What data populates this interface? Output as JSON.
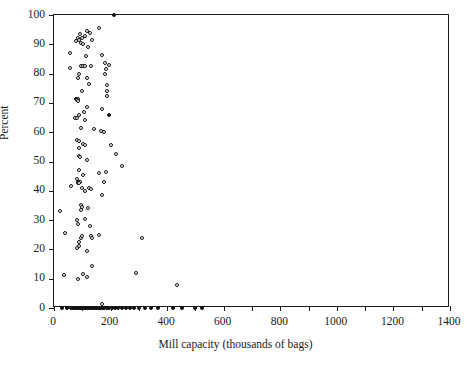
{
  "chart_data": {
    "type": "scatter",
    "title": "",
    "xlabel": "Mill capacity (thousands of bags)",
    "ylabel": "Percent",
    "xlim": [
      0,
      1400
    ],
    "ylim": [
      0,
      100
    ],
    "xticks": [
      0,
      100,
      200,
      300,
      400,
      500,
      600,
      700,
      800,
      900,
      1000,
      1100,
      1200,
      1300,
      1400
    ],
    "xtick_labels": [
      "0",
      "",
      "200",
      "",
      "400",
      "",
      "600",
      "",
      "800",
      "",
      "1000",
      "",
      "1200",
      "",
      "1400"
    ],
    "xtick_labels_shown": [
      "0",
      "200",
      "400",
      "600",
      "800",
      "1000",
      "1200",
      "1400"
    ],
    "yticks": [
      0,
      10,
      20,
      30,
      40,
      50,
      60,
      70,
      80,
      90,
      100
    ],
    "ytick_labels": [
      "0",
      "10",
      "20",
      "30",
      "40",
      "50",
      "60",
      "70",
      "80",
      "90",
      "100"
    ],
    "grid": false,
    "legend": false,
    "marker": "open-diamond",
    "marker_color": "#111111",
    "frame": "box",
    "series": [
      {
        "name": "mills",
        "points": [
          [
            212,
            100
          ],
          [
            160,
            95.5
          ],
          [
            115,
            94.5
          ],
          [
            128,
            94.0
          ],
          [
            93,
            93.5
          ],
          [
            108,
            93.0
          ],
          [
            100,
            92.0
          ],
          [
            86,
            92.0
          ],
          [
            90,
            91.5
          ],
          [
            133,
            91.5
          ],
          [
            78,
            91.0
          ],
          [
            96,
            90.5
          ],
          [
            103,
            90.0
          ],
          [
            120,
            89.0
          ],
          [
            58,
            87.0
          ],
          [
            170,
            86.5
          ],
          [
            113,
            86.0
          ],
          [
            55,
            82.0
          ],
          [
            180,
            83.5
          ],
          [
            195,
            83.0
          ],
          [
            96,
            82.5
          ],
          [
            104,
            82.5
          ],
          [
            110,
            82.5
          ],
          [
            130,
            82.5
          ],
          [
            185,
            81.5
          ],
          [
            88,
            80.0
          ],
          [
            180,
            80.0
          ],
          [
            84,
            78.5
          ],
          [
            118,
            78.5
          ],
          [
            122,
            76.5
          ],
          [
            187,
            76.0
          ],
          [
            100,
            74.0
          ],
          [
            186,
            74.0
          ],
          [
            186,
            72.5
          ],
          [
            78,
            71.5
          ],
          [
            82,
            71.5
          ],
          [
            86,
            71.5
          ],
          [
            80,
            71.0
          ],
          [
            84,
            70.5
          ],
          [
            118,
            68.5
          ],
          [
            168,
            68.0
          ],
          [
            105,
            67.0
          ],
          [
            193,
            66.0
          ],
          [
            90,
            66.0
          ],
          [
            74,
            65.0
          ],
          [
            82,
            64.8
          ],
          [
            108,
            64.0
          ],
          [
            94,
            61.5
          ],
          [
            143,
            61.0
          ],
          [
            167,
            60.5
          ],
          [
            175,
            60.0
          ],
          [
            80,
            57.5
          ],
          [
            88,
            57.0
          ],
          [
            101,
            56.0
          ],
          [
            110,
            55.5
          ],
          [
            200,
            55.5
          ],
          [
            88,
            54.5
          ],
          [
            90,
            52.0
          ],
          [
            92,
            51.5
          ],
          [
            218,
            52.5
          ],
          [
            115,
            50.5
          ],
          [
            240,
            48.5
          ],
          [
            90,
            47.0
          ],
          [
            104,
            45.5
          ],
          [
            160,
            46.0
          ],
          [
            184,
            46.5
          ],
          [
            80,
            44.0
          ],
          [
            85,
            43.0
          ],
          [
            88,
            43.0
          ],
          [
            92,
            43.0
          ],
          [
            86,
            42.5
          ],
          [
            90,
            42.5
          ],
          [
            60,
            41.5
          ],
          [
            122,
            41.0
          ],
          [
            100,
            41.0
          ],
          [
            178,
            43.0
          ],
          [
            110,
            40.0
          ],
          [
            132,
            40.5
          ],
          [
            168,
            38.5
          ],
          [
            97,
            35.0
          ],
          [
            100,
            34.5
          ],
          [
            120,
            34.0
          ],
          [
            96,
            33.5
          ],
          [
            22,
            33.0
          ],
          [
            82,
            30.0
          ],
          [
            110,
            30.5
          ],
          [
            86,
            28.5
          ],
          [
            128,
            28.0
          ],
          [
            40,
            25.5
          ],
          [
            160,
            25.0
          ],
          [
            94,
            24.0
          ],
          [
            100,
            24.5
          ],
          [
            130,
            24.5
          ],
          [
            136,
            24.0
          ],
          [
            310,
            24.0
          ],
          [
            88,
            22.5
          ],
          [
            90,
            21.0
          ],
          [
            82,
            20.5
          ],
          [
            118,
            19.5
          ],
          [
            134,
            14.5
          ],
          [
            290,
            12.0
          ],
          [
            34,
            11.3
          ],
          [
            104,
            11.5
          ],
          [
            118,
            10.5
          ],
          [
            86,
            10.0
          ],
          [
            436,
            8.0
          ],
          [
            30,
            0
          ],
          [
            45,
            0
          ],
          [
            60,
            0
          ],
          [
            68,
            0
          ],
          [
            74,
            0
          ],
          [
            80,
            0
          ],
          [
            86,
            0
          ],
          [
            92,
            0
          ],
          [
            97,
            0
          ],
          [
            102,
            0
          ],
          [
            107,
            0
          ],
          [
            112,
            0
          ],
          [
            118,
            0
          ],
          [
            124,
            0
          ],
          [
            130,
            0
          ],
          [
            136,
            0
          ],
          [
            142,
            0
          ],
          [
            148,
            0
          ],
          [
            154,
            0
          ],
          [
            160,
            0
          ],
          [
            166,
            0
          ],
          [
            172,
            0
          ],
          [
            178,
            0
          ],
          [
            186,
            0
          ],
          [
            196,
            0
          ],
          [
            206,
            0
          ],
          [
            216,
            0
          ],
          [
            228,
            0
          ],
          [
            240,
            0
          ],
          [
            254,
            0
          ],
          [
            268,
            0
          ],
          [
            282,
            0
          ],
          [
            300,
            0
          ],
          [
            320,
            0
          ],
          [
            344,
            0
          ],
          [
            366,
            0
          ],
          [
            420,
            0
          ],
          [
            452,
            0
          ],
          [
            500,
            0
          ],
          [
            522,
            0
          ],
          [
            168,
            1.2
          ]
        ],
        "filled_points": [
          [
            212,
            100
          ],
          [
            193,
            66
          ],
          [
            30,
            0
          ],
          [
            45,
            0
          ],
          [
            60,
            0
          ],
          [
            68,
            0
          ],
          [
            74,
            0
          ],
          [
            80,
            0
          ],
          [
            86,
            0
          ],
          [
            92,
            0
          ],
          [
            97,
            0
          ],
          [
            102,
            0
          ],
          [
            107,
            0
          ],
          [
            112,
            0
          ],
          [
            118,
            0
          ],
          [
            124,
            0
          ],
          [
            130,
            0
          ],
          [
            136,
            0
          ],
          [
            142,
            0
          ],
          [
            148,
            0
          ],
          [
            154,
            0
          ],
          [
            160,
            0
          ],
          [
            166,
            0
          ],
          [
            172,
            0
          ],
          [
            178,
            0
          ],
          [
            186,
            0
          ],
          [
            196,
            0
          ],
          [
            206,
            0
          ],
          [
            216,
            0
          ],
          [
            228,
            0
          ],
          [
            240,
            0
          ],
          [
            254,
            0
          ],
          [
            268,
            0
          ],
          [
            282,
            0
          ],
          [
            300,
            0
          ],
          [
            320,
            0
          ],
          [
            344,
            0
          ],
          [
            366,
            0
          ],
          [
            420,
            0
          ],
          [
            452,
            0
          ],
          [
            500,
            0
          ],
          [
            522,
            0
          ]
        ]
      }
    ]
  }
}
